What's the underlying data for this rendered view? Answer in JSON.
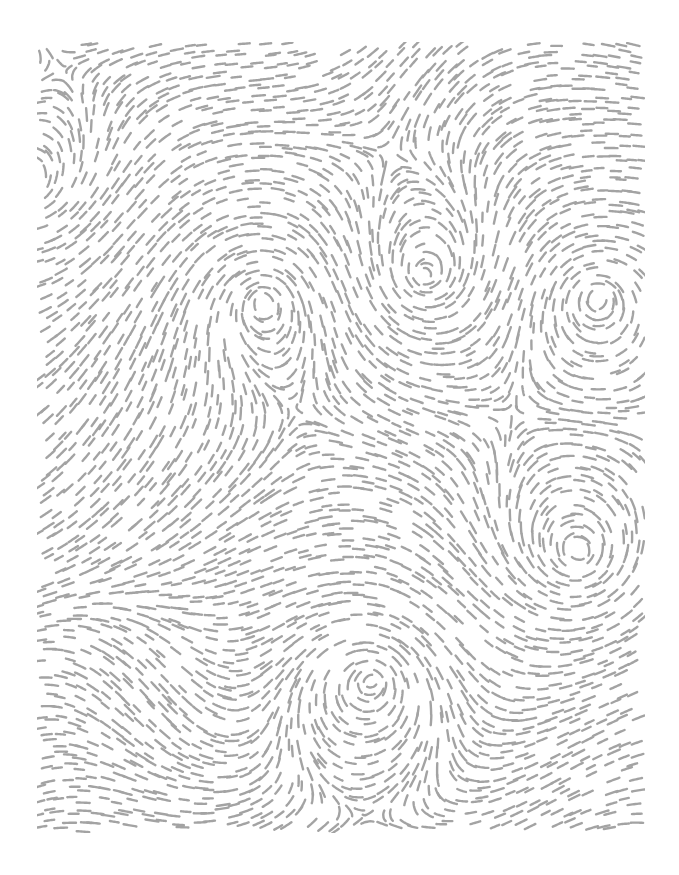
{
  "artwork": {
    "kind": "flow-field-dashes",
    "background": "#ffffff",
    "dash_color": "#a3a3a3",
    "frame": {
      "x": 37,
      "y": 42,
      "width": 608,
      "height": 791
    },
    "dash_length": 11,
    "dash_width": 2.4,
    "grid_spacing": 11.5,
    "vortices": [
      {
        "name": "vortex-upper-left",
        "x": 263,
        "y": 300,
        "strength": 1.0
      },
      {
        "name": "vortex-upper-middle",
        "x": 425,
        "y": 276,
        "strength": -1.0
      },
      {
        "name": "vortex-upper-right",
        "x": 597,
        "y": 297,
        "strength": 1.0
      },
      {
        "name": "vortex-right-middle",
        "x": 580,
        "y": 553,
        "strength": -1.0
      },
      {
        "name": "vortex-lower-middle",
        "x": 372,
        "y": 680,
        "strength": 1.0
      },
      {
        "name": "vortex-left-edge",
        "x": 25,
        "y": 185,
        "strength": -0.8
      }
    ]
  }
}
